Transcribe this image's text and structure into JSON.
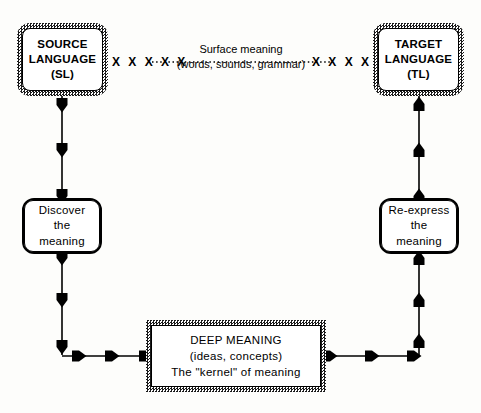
{
  "diagram": {
    "background_color": "#fdfdfb",
    "ink_color": "#000000"
  },
  "nodes": {
    "source_language": {
      "line1": "SOURCE",
      "line2": "LANGUAGE",
      "line3": "(SL)",
      "border_style": "hatched-rounded"
    },
    "target_language": {
      "line1": "TARGET",
      "line2": "LANGUAGE",
      "line3": "(TL)",
      "border_style": "hatched-rounded"
    },
    "discover": {
      "line1": "Discover",
      "line2": "the",
      "line3": "meaning",
      "border_style": "plain-rounded"
    },
    "reexpress": {
      "line1": "Re-express",
      "line2": "the",
      "line3": "meaning",
      "border_style": "plain-rounded"
    },
    "deep_meaning": {
      "line1": "DEEP MEANING",
      "line2": "(ideas, concepts)",
      "line3": "The \"kernel\" of meaning",
      "border_style": "hatched-rectangle"
    }
  },
  "edges": {
    "surface_meaning": {
      "caption_line1": "Surface meaning",
      "caption_line2": "(words, sounds, grammar)",
      "style": "dotted-with-x-marks",
      "x_marks_left": "X X X X X",
      "x_marks_right": "X X X X X"
    },
    "sl_to_discover": {
      "direction": "down",
      "arrow_count": 3
    },
    "discover_to_deep": {
      "direction": "down-then-right",
      "arrow_count": 6
    },
    "deep_to_reexpress": {
      "direction": "right-then-up",
      "arrow_count": 6
    },
    "reexpress_to_tl": {
      "direction": "up",
      "arrow_count": 3
    }
  }
}
